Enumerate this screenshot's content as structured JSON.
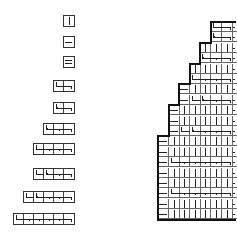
{
  "figure": {
    "stroke_color": "#222222",
    "background": "#ffffff"
  },
  "pieces": [
    {
      "id": "p1",
      "cells": [
        "vbar"
      ]
    },
    {
      "id": "p2",
      "cells": [
        "hbar"
      ]
    },
    {
      "id": "p3",
      "cells": [
        "double-hbar"
      ]
    },
    {
      "id": "p4",
      "cells": [
        "hook-start",
        "hook-end"
      ]
    },
    {
      "id": "p5",
      "cells": [
        "hook-arrow",
        "hook-end"
      ]
    },
    {
      "id": "p6",
      "cells": [
        "hook-arrow",
        "tick",
        "hook-end"
      ]
    },
    {
      "id": "p7",
      "cells": [
        "hook-start",
        "tick",
        "tick",
        "hook-end"
      ]
    },
    {
      "id": "p8",
      "cells": [
        "hook-start",
        "hook-arrow",
        "tick",
        "hook-end"
      ]
    },
    {
      "id": "p9",
      "cells": [
        "hook-start",
        "hook-arrow",
        "tick",
        "tick",
        "hook-end"
      ]
    },
    {
      "id": "p10",
      "cells": [
        "hook-start",
        "tick",
        "tick",
        "tick",
        "tick",
        "hook-end"
      ]
    }
  ],
  "tableau": {
    "rows": [
      {
        "start": 5,
        "cells": [
          "hook-start",
          "hook-end",
          "edge"
        ]
      },
      {
        "start": 5,
        "cells": [
          "hook-arrow",
          "hook-end",
          "edge"
        ]
      },
      {
        "start": 4,
        "cells": [
          "vbar",
          "vbar",
          "vbar",
          "edge"
        ]
      },
      {
        "start": 4,
        "cells": [
          "hook-arrow",
          "tick",
          "hook-end",
          "edge"
        ]
      },
      {
        "start": 3,
        "cells": [
          "vbar",
          "vbar",
          "vbar",
          "vbar",
          "edge"
        ]
      },
      {
        "start": 3,
        "cells": [
          "hook-start",
          "tick",
          "tick",
          "hook-end",
          "edge"
        ]
      },
      {
        "start": 2,
        "cells": [
          "hbar",
          "vbar",
          "vbar",
          "vbar",
          "vbar",
          "edge"
        ]
      },
      {
        "start": 2,
        "cells": [
          "hbar",
          "hook-start",
          "hook-arrow",
          "tick",
          "hook-end",
          "edge"
        ]
      },
      {
        "start": 1,
        "cells": [
          "hbar",
          "vbar",
          "vbar",
          "vbar",
          "vbar",
          "vbar",
          "edge"
        ]
      },
      {
        "start": 1,
        "cells": [
          "hbar",
          "vbar",
          "vbar",
          "vbar",
          "vbar",
          "vbar",
          "edge"
        ]
      },
      {
        "start": 1,
        "cells": [
          "hbar",
          "hook-start",
          "hook-arrow",
          "tick",
          "tick",
          "hook-end",
          "edge"
        ]
      },
      {
        "start": 0,
        "cells": [
          "hbar",
          "vbar",
          "vbar",
          "vbar",
          "vbar",
          "vbar",
          "vbar",
          "edge"
        ]
      },
      {
        "start": 0,
        "cells": [
          "hbar",
          "vbar",
          "vbar",
          "vbar",
          "vbar",
          "vbar",
          "vbar",
          "edge"
        ]
      },
      {
        "start": 0,
        "cells": [
          "hbar",
          "hook-start",
          "tick",
          "tick",
          "tick",
          "tick",
          "hook-end",
          "edge"
        ]
      },
      {
        "start": 0,
        "cells": [
          "hbar",
          "vbar",
          "vbar",
          "vbar",
          "vbar",
          "vbar",
          "vbar",
          "edge"
        ]
      },
      {
        "start": 0,
        "cells": [
          "hbar",
          "vbar",
          "vbar",
          "vbar",
          "vbar",
          "vbar",
          "vbar",
          "edge"
        ]
      },
      {
        "start": 0,
        "cells": [
          "hbar",
          "hook-start",
          "tick",
          "tick",
          "tick",
          "tick",
          "hook-end",
          "edge"
        ]
      },
      {
        "start": 0,
        "cells": [
          "hbar",
          "vbar",
          "vbar",
          "vbar",
          "vbar",
          "vbar",
          "vbar",
          "edge"
        ]
      },
      {
        "start": 0,
        "cells": [
          "hbar",
          "vbar",
          "vbar",
          "vbar",
          "vbar",
          "vbar",
          "vbar",
          "edge"
        ]
      }
    ]
  }
}
